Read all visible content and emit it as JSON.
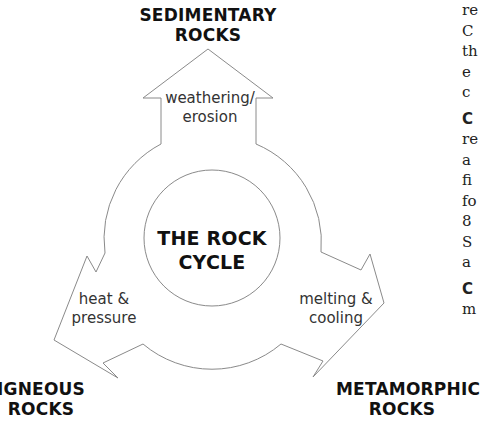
{
  "diagram": {
    "title_lines": [
      "THE ROCK",
      "CYCLE"
    ],
    "nodes": {
      "top": {
        "lines": [
          "SEDIMENTARY",
          "ROCKS"
        ]
      },
      "bottom_left": {
        "lines": [
          "IGNEOUS",
          "ROCKS"
        ]
      },
      "bottom_right": {
        "lines": [
          "METAMORPHIC",
          "ROCKS"
        ]
      }
    },
    "processes": {
      "top_arrow": {
        "lines": [
          "weathering/",
          "erosion"
        ]
      },
      "left_arrow": {
        "lines": [
          "heat &",
          "pressure"
        ]
      },
      "right_arrow": {
        "lines": [
          "melting &",
          "cooling"
        ]
      }
    },
    "colors": {
      "outline": "#8a8a8a",
      "bold_text": "#111111",
      "process_text": "#333333",
      "background": "#ffffff"
    }
  },
  "side_text_fragments": {
    "lines": [
      "re",
      "C",
      "th",
      "e",
      "c",
      "C",
      "re",
      "a",
      "fi",
      "fo",
      "8",
      "S",
      "a",
      "C",
      "m"
    ]
  }
}
